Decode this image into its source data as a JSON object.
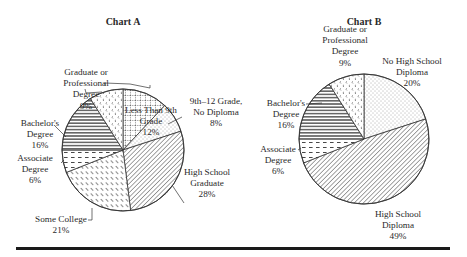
{
  "chart_data": [
    {
      "type": "pie",
      "title": "Chart A",
      "center": [
        123,
        150
      ],
      "radius": 61,
      "slices": [
        {
          "label": "Less Than 9th Grade",
          "lines": [
            "Less Than 9th",
            "Grade",
            "12%"
          ],
          "value": 12,
          "pattern": "pat-grid",
          "label_pos": [
            151,
            113
          ],
          "label_anchor": "middle",
          "leader": [
            [
              105,
              86
            ],
            [
              105,
              83
            ],
            [
              130,
              84
            ],
            [
              150,
              88
            ],
            [
              150,
              85
            ]
          ]
        },
        {
          "label": "9th–12 Grade, No Diploma",
          "lines": [
            "9th–12 Grade,",
            "No Diploma",
            "8%"
          ],
          "value": 8,
          "pattern": "pat-dots",
          "label_pos": [
            216,
            104
          ],
          "label_anchor": "middle",
          "leader": [
            [
              168,
              124
            ],
            [
              182,
              117
            ]
          ]
        },
        {
          "label": "High School Graduate",
          "lines": [
            "High School",
            "Graduate",
            "28%"
          ],
          "value": 28,
          "pattern": "pat-diag",
          "label_pos": [
            207,
            175
          ],
          "label_anchor": "middle",
          "leader": [
            [
              172,
              185
            ],
            [
              184,
              203
            ]
          ]
        },
        {
          "label": "Some College",
          "lines": [
            "Some College",
            "21%"
          ],
          "value": 21,
          "pattern": "pat-short-diag",
          "label_pos": [
            61,
            222
          ],
          "label_anchor": "middle",
          "leader": [
            [
              92,
              208
            ],
            [
              92,
              220
            ],
            [
              88,
              220
            ]
          ]
        },
        {
          "label": "Associate Degree",
          "lines": [
            "Associate",
            "Degree",
            "6%"
          ],
          "value": 6,
          "pattern": "pat-dash",
          "label_pos": [
            35,
            161
          ],
          "label_anchor": "middle",
          "leader": [
            [
              64,
              160
            ],
            [
              61,
              163
            ]
          ]
        },
        {
          "label": "Bachelor's Degree",
          "lines": [
            "Bachelor's",
            "Degree",
            "16%"
          ],
          "value": 16,
          "pattern": "pat-hlines",
          "label_pos": [
            40,
            126
          ],
          "label_anchor": "middle",
          "leader": [
            [
              54,
              125
            ],
            [
              58,
              129
            ],
            [
              66,
              137
            ]
          ]
        },
        {
          "label": "Graduate or Professional Degree",
          "lines": [
            "Graduate or",
            "Professional",
            "Degree",
            "9%"
          ],
          "value": 9,
          "pattern": "pat-chevron",
          "label_pos": [
            86,
            75
          ],
          "label_anchor": "middle",
          "leader": [
            [
              85,
              89
            ],
            [
              86,
              93
            ],
            [
              102,
              92
            ]
          ]
        }
      ]
    },
    {
      "type": "pie",
      "title": "Chart B",
      "center": [
        364,
        139
      ],
      "radius": 65,
      "slices": [
        {
          "label": "No High School Diploma",
          "lines": [
            "No High School",
            "Diploma",
            "20%"
          ],
          "value": 20,
          "pattern": "pat-dots",
          "label_pos": [
            412,
            64
          ],
          "label_anchor": "middle",
          "leader": []
        },
        {
          "label": "High School Diploma",
          "lines": [
            "High School",
            "Diploma",
            "49%"
          ],
          "value": 49,
          "pattern": "pat-diag",
          "label_pos": [
            398,
            217
          ],
          "label_anchor": "middle",
          "leader": []
        },
        {
          "label": "Associate Degree",
          "lines": [
            "Associate",
            "Degree",
            "6%"
          ],
          "value": 6,
          "pattern": "pat-dash",
          "label_pos": [
            278,
            152
          ],
          "label_anchor": "middle",
          "leader": [
            [
              298,
              150
            ],
            [
              301,
              148
            ]
          ]
        },
        {
          "label": "Bachelor's Degree",
          "lines": [
            "Bachelor's",
            "Degree",
            "16%"
          ],
          "value": 16,
          "pattern": "pat-hlines",
          "label_pos": [
            286,
            106
          ],
          "label_anchor": "middle",
          "leader": [
            [
              306,
              104
            ],
            [
              322,
              103
            ]
          ]
        },
        {
          "label": "Graduate or Professional Degree",
          "lines": [
            "Graduate or",
            "Professional",
            "Degree",
            "9%"
          ],
          "value": 9,
          "pattern": "pat-chevron",
          "label_pos": [
            345,
            32
          ],
          "label_anchor": "middle",
          "leader": []
        }
      ]
    }
  ],
  "rule": {
    "color": "#1a1a1a"
  }
}
